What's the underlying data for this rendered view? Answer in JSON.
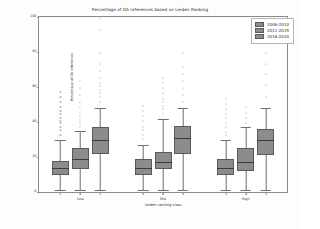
{
  "chart_data": {
    "type": "box",
    "title": "Percentage of OA references based on Leiden Ranking",
    "xlabel": "Leiden ranking class",
    "ylabel": "Percentage of OA references",
    "categories": [
      "Low",
      "Mid",
      "High"
    ],
    "ylim": [
      0,
      100
    ],
    "yticks": [
      0,
      20,
      40,
      60,
      80,
      100
    ],
    "ytick_labels": [
      "0",
      "20",
      "40",
      "60",
      "80",
      "100"
    ],
    "grid": false,
    "legend_position": "upper right",
    "box_color": "#8c8c8c",
    "edge_color": "#5a5a5a",
    "median_color": "#3b3b3b",
    "series": [
      {
        "name": "2006-2010",
        "boxes": [
          {
            "category": "Low",
            "whisker_low": 1,
            "q1": 10,
            "median": 14,
            "q3": 18,
            "whisker_high": 30,
            "fliers": [
              33,
              36,
              38,
              40,
              41,
              43,
              45,
              47,
              49,
              52,
              55,
              58
            ]
          },
          {
            "category": "Mid",
            "whisker_low": 1,
            "q1": 10,
            "median": 14,
            "q3": 19,
            "whisker_high": 27,
            "fliers": [
              31,
              33,
              36,
              38,
              41,
              44,
              47,
              50
            ]
          },
          {
            "category": "High",
            "whisker_low": 1,
            "q1": 10,
            "median": 14,
            "q3": 19,
            "whisker_high": 30,
            "fliers": [
              33,
              35,
              38,
              40,
              43,
              45,
              48,
              51,
              54
            ]
          }
        ]
      },
      {
        "name": "2011-2015",
        "boxes": [
          {
            "category": "Low",
            "whisker_low": 1,
            "q1": 13,
            "median": 19,
            "q3": 25,
            "whisker_high": 35,
            "fliers": [
              38,
              40,
              42,
              44,
              46,
              49,
              52,
              56,
              60,
              64
            ]
          },
          {
            "category": "Mid",
            "whisker_low": 1,
            "q1": 13,
            "median": 17,
            "q3": 23,
            "whisker_high": 42,
            "fliers": [
              45,
              48,
              50,
              52,
              54,
              57,
              60,
              63,
              66
            ]
          },
          {
            "category": "High",
            "whisker_low": 1,
            "q1": 12,
            "median": 17,
            "q3": 25,
            "whisker_high": 37,
            "fliers": [
              40,
              43,
              46,
              49
            ]
          }
        ]
      },
      {
        "name": "2016-2020",
        "boxes": [
          {
            "category": "Low",
            "whisker_low": 1,
            "q1": 22,
            "median": 30,
            "q3": 37,
            "whisker_high": 48,
            "fliers": [
              52,
              55,
              57,
              59,
              61,
              63,
              66,
              70,
              74,
              80,
              93,
              100
            ]
          },
          {
            "category": "Mid",
            "whisker_low": 1,
            "q1": 22,
            "median": 31,
            "q3": 38,
            "whisker_high": 48,
            "fliers": [
              52,
              56,
              60,
              64,
              68,
              72,
              80
            ]
          },
          {
            "category": "High",
            "whisker_low": 1,
            "q1": 21,
            "median": 30,
            "q3": 36,
            "whisker_high": 48,
            "fliers": [
              55,
              62,
              68,
              74,
              80
            ]
          }
        ]
      }
    ]
  },
  "legend": {
    "items": [
      {
        "label": "2006-2010"
      },
      {
        "label": "2011-2015"
      },
      {
        "label": "2016-2020"
      }
    ]
  }
}
